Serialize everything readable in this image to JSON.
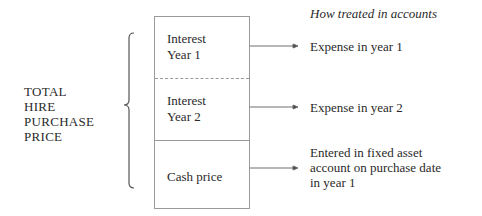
{
  "left_label": {
    "lines": [
      "TOTAL",
      "HIRE",
      "PURCHASE",
      "PRICE"
    ]
  },
  "column_heading": "How treated in accounts",
  "segments": [
    {
      "lines": [
        "Interest",
        "Year 1"
      ],
      "treatment": [
        "Expense in year 1"
      ]
    },
    {
      "lines": [
        "Interest",
        "Year 2"
      ],
      "treatment": [
        "Expense in year 2"
      ]
    },
    {
      "lines": [
        "Cash price"
      ],
      "treatment": [
        "Entered in fixed asset",
        "account on purchase date",
        "in year 1"
      ]
    }
  ],
  "colors": {
    "line": "#6e6e6e",
    "box_border": "#9a9a9a",
    "text": "#2a2a2a"
  }
}
